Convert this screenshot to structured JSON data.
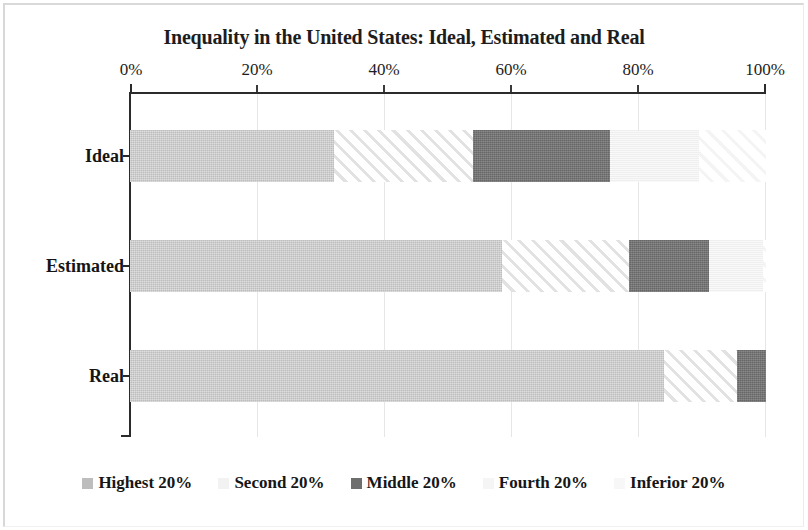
{
  "chart_data": {
    "type": "bar",
    "orientation": "horizontal",
    "stacked": true,
    "stack_mode": "percent",
    "title": "Inequality in the United States: Ideal, Estimated and Real",
    "xlabel": "",
    "ylabel": "",
    "categories": [
      "Ideal",
      "Estimated",
      "Real"
    ],
    "xlim": [
      0,
      100
    ],
    "xticks": [
      0,
      20,
      40,
      60,
      80,
      100
    ],
    "xticklabels": [
      "0%",
      "20%",
      "40%",
      "60%",
      "80%",
      "100%"
    ],
    "grid": true,
    "grid_axis": "x",
    "legend_position": "bottom",
    "series": [
      {
        "name": "Highest 20%",
        "color": "#cbcbcb",
        "swatch": "#bdbdbd",
        "values": [
          32.0,
          58.5,
          84.0
        ]
      },
      {
        "name": "Second 20%",
        "color": "#e2e2e2",
        "swatch": "#f2f2f2",
        "values": [
          22.0,
          20.0,
          11.5
        ]
      },
      {
        "name": "Middle 20%",
        "color": "#767676",
        "swatch": "#6e6e6e",
        "values": [
          21.5,
          12.5,
          4.5
        ]
      },
      {
        "name": "Fourth 20%",
        "color": "#f3f3f3",
        "swatch": "#f5f5f5",
        "values": [
          14.0,
          8.5,
          0.0
        ]
      },
      {
        "name": "Inferior 20%",
        "color": "#fbfbfb",
        "swatch": "#f7f7f7",
        "values": [
          10.5,
          0.5,
          0.0
        ]
      }
    ]
  },
  "axis": {
    "tick_0": "0%",
    "tick_1": "20%",
    "tick_2": "40%",
    "tick_3": "60%",
    "tick_4": "80%",
    "tick_5": "100%"
  },
  "rows": {
    "row_0_label": "Ideal",
    "row_1_label": "Estimated",
    "row_2_label": "Real"
  },
  "legend": {
    "item_0": "Highest 20%",
    "item_1": "Second 20%",
    "item_2": "Middle 20%",
    "item_3": "Fourth 20%",
    "item_4": "Inferior 20%"
  }
}
